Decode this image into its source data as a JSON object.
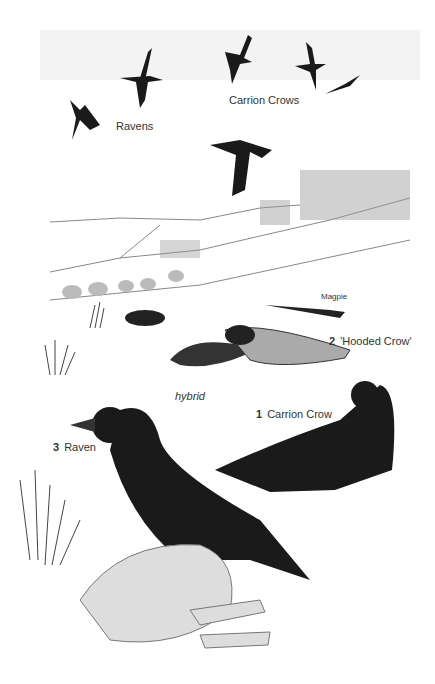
{
  "labels": {
    "ravens": "Ravens",
    "carrion_crows": "Carrion Crows",
    "magpie": "Magpie",
    "hooded_crow_num": "2",
    "hooded_crow": "'Hooded Crow'",
    "hybrid": "hybrid",
    "carrion_crow_num": "1",
    "carrion_crow": "Carrion Crow",
    "raven_num": "3",
    "raven": "Raven"
  },
  "colors": {
    "background": "#ffffff",
    "bird": "#1a1a1a",
    "landscape": "#888888"
  }
}
